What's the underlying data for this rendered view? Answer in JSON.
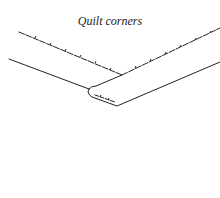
{
  "diagram": {
    "title": "Quilt corners",
    "line_color": "#222222",
    "background": "#ffffff"
  }
}
